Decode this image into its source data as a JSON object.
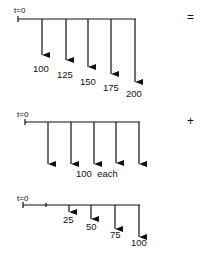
{
  "colors": {
    "ink": "#111111",
    "background": "#ffffff"
  },
  "diagram1": {
    "origin_label": "t=0",
    "operator": "=",
    "arrows": [
      {
        "label": "100"
      },
      {
        "label": "125"
      },
      {
        "label": "150"
      },
      {
        "label": "175"
      },
      {
        "label": "200"
      }
    ]
  },
  "diagram2": {
    "origin_label": "t=0",
    "operator": "+",
    "caption": "100  each",
    "arrow_count": 5
  },
  "diagram3": {
    "origin_label": "t=0",
    "arrows": [
      {
        "label": "25"
      },
      {
        "label": "50"
      },
      {
        "label": "75"
      },
      {
        "label": "100"
      }
    ]
  }
}
